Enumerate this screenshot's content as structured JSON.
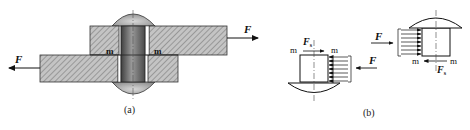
{
  "figure_a": {
    "caption": "(a)",
    "force_right_label": "F",
    "force_left_label": "F",
    "shear_plane_left_label": "m",
    "shear_plane_right_label": "m"
  },
  "figure_b": {
    "caption": "(b)",
    "lower_part": {
      "force_label": "F",
      "shear_force_label": "F",
      "shear_force_subscript": "s",
      "m_left": "m",
      "m_right": "m"
    },
    "upper_part": {
      "force_label": "F",
      "shear_force_label": "F",
      "shear_force_subscript": "s",
      "m_left": "m",
      "m_right": "m"
    }
  },
  "colors": {
    "hatch_fill": "#b8b8b8",
    "rivet_dark": "#6a6a6a",
    "rivet_light": "#cfcfcf",
    "line": "#222222"
  }
}
